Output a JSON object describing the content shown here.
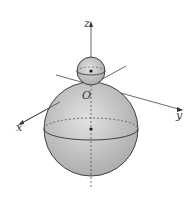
{
  "diagram": {
    "axes": {
      "x_label": "x",
      "y_label": "y",
      "z_label": "z",
      "origin_label": "O"
    },
    "small_sphere": {
      "cx": 91,
      "cy": 71,
      "r": 14
    },
    "large_sphere": {
      "cx": 91,
      "cy": 129,
      "r": 47
    },
    "colors": {
      "sphere_fill": "#c8c8c8",
      "line": "#333333"
    }
  }
}
